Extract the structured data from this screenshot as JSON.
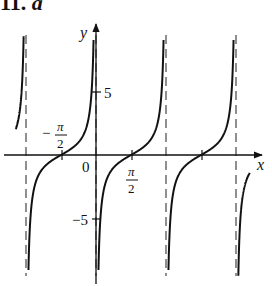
{
  "problem": {
    "label": "11.",
    "suffix": "a"
  },
  "chart_data": {
    "type": "line",
    "title": "",
    "function": "y = tan(x - π/2) = -cot(x)",
    "xlabel": "x",
    "ylabel": "y",
    "xlim": [
      -3.6,
      7.0
    ],
    "ylim": [
      -9.5,
      9.5
    ],
    "grid": false,
    "x_tick_labels": [
      {
        "value": -1.5708,
        "label": "-π/2"
      },
      {
        "value": 0,
        "label": "0"
      },
      {
        "value": 1.5708,
        "label": "π/2"
      }
    ],
    "y_tick_labels": [
      {
        "value": 5,
        "label": "5"
      },
      {
        "value": -5,
        "label": "-5"
      }
    ],
    "vertical_asymptotes": [
      -3.1416,
      0,
      3.1416,
      6.2832
    ],
    "zeros": [
      -1.5708,
      1.5708,
      4.7124
    ],
    "series": [
      {
        "name": "branch-left-partial",
        "x_range": [
          -3.6,
          -3.1416
        ]
      },
      {
        "name": "branch-1",
        "x_range": [
          -3.1416,
          0
        ]
      },
      {
        "name": "branch-2",
        "x_range": [
          0,
          3.1416
        ]
      },
      {
        "name": "branch-3",
        "x_range": [
          3.1416,
          6.2832
        ]
      },
      {
        "name": "branch-right-partial",
        "x_range": [
          6.2832,
          6.9
        ]
      }
    ]
  },
  "labels": {
    "x_axis": "x",
    "y_axis": "y",
    "origin": "0",
    "neg_half_pi_num": "π",
    "neg_half_pi_den": "2",
    "neg_sign": "−",
    "half_pi_num": "π",
    "half_pi_den": "2",
    "tick_5": "5",
    "tick_neg5": "−5"
  }
}
